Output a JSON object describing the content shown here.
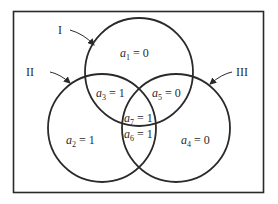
{
  "diagram": {
    "type": "venn",
    "stroke_color": "#2a2a2a",
    "background": "#ffffff",
    "sets": [
      {
        "label": "I",
        "cx": 139,
        "cy": 72,
        "r": 54,
        "label_x": 62,
        "label_y": 34,
        "arrow": "M70,30 Q84,34 94,45"
      },
      {
        "label": "II",
        "cx": 102,
        "cy": 128,
        "r": 54,
        "label_x": 34,
        "label_y": 76,
        "arrow": "M50,72 Q60,74 70,83"
      },
      {
        "label": "III",
        "cx": 176,
        "cy": 128,
        "r": 54,
        "label_x": 236,
        "label_y": 76,
        "arrow": "M232,72 Q222,74 210,84"
      }
    ],
    "regions": [
      {
        "var": "a",
        "sub": "1",
        "eq": " = 0",
        "x": 120,
        "y": 57
      },
      {
        "var": "a",
        "sub": "2",
        "eq": " = 1",
        "x": 66,
        "y": 144
      },
      {
        "var": "a",
        "sub": "3",
        "eq": " = 1",
        "x": 96,
        "y": 97
      },
      {
        "var": "a",
        "sub": "4",
        "eq": " = 0",
        "x": 181,
        "y": 144
      },
      {
        "var": "a",
        "sub": "5",
        "eq": " = 0",
        "x": 152,
        "y": 97
      },
      {
        "var": "a",
        "sub": "6",
        "eq": " = 1",
        "x": 124,
        "y": 138
      },
      {
        "var": "a",
        "sub": "7",
        "eq": " = 1",
        "x": 124,
        "y": 122
      }
    ]
  }
}
